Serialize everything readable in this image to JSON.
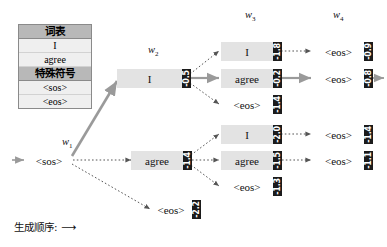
{
  "legend": {
    "vocab_header": "词表",
    "vocab_items": [
      "I",
      "agree"
    ],
    "special_header": "特殊符号",
    "special_items": [
      "<sos>",
      "<eos>"
    ]
  },
  "columns": [
    {
      "id": "w1",
      "label": "w",
      "sub": "1"
    },
    {
      "id": "w2",
      "label": "w",
      "sub": "2"
    },
    {
      "id": "w3",
      "label": "w",
      "sub": "3"
    },
    {
      "id": "w4",
      "label": "w",
      "sub": "4"
    }
  ],
  "caption": "生成顺序: ⟶",
  "colors": {
    "node_fill": "#e3e3e3",
    "chip_fill": "#1b1b1b",
    "chip_text": "#ffffff",
    "legend_header": "#b8b8b8",
    "legend_row": "#efefef",
    "beam_arrow": "#9a9a9a",
    "candidate_arrow": "#555555"
  },
  "nodes": {
    "w1_sos": {
      "token": "<sos>",
      "score": ""
    },
    "w2_i": {
      "token": "I",
      "score": "-0.5"
    },
    "w2_agree": {
      "token": "agree",
      "score": "-1.4"
    },
    "w2_eos": {
      "token": "<eos>",
      "score": "-2.2"
    },
    "w3_top_i": {
      "token": "I",
      "score": "-1.8"
    },
    "w3_top_agree": {
      "token": "agree",
      "score": "-0.2"
    },
    "w3_top_eos": {
      "token": "<eos>",
      "score": "-1.4"
    },
    "w3_bot_i": {
      "token": "I",
      "score": "-2.0"
    },
    "w3_bot_agree": {
      "token": "agree",
      "score": "-1.5"
    },
    "w3_bot_eos": {
      "token": "<eos>",
      "score": "-1.3"
    },
    "w4_top_eos": {
      "token": "<eos>",
      "score": "-0.9"
    },
    "w4_sel_eos": {
      "token": "<eos>",
      "score": "-0.8"
    },
    "w4_bot1_eos": {
      "token": "<eos>",
      "score": "-1.4"
    },
    "w4_bot2_eos": {
      "token": "<eos>",
      "score": "-1.1"
    }
  }
}
